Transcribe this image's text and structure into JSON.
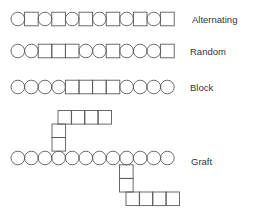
{
  "colors": {
    "stroke": "#5a5a5a",
    "text": "#333333",
    "background": "#ffffff"
  },
  "shape_size": 13.6,
  "rows": [
    {
      "id": "alternating",
      "label": "Alternating",
      "sequence": [
        "circle",
        "square",
        "circle",
        "square",
        "circle",
        "square",
        "circle",
        "square",
        "circle",
        "square",
        "circle",
        "square"
      ],
      "x": 11,
      "cy": 19,
      "label_x": 192
    },
    {
      "id": "random",
      "label": "Random",
      "sequence": [
        "circle",
        "circle",
        "square",
        "square",
        "square",
        "circle",
        "circle",
        "square",
        "circle",
        "circle",
        "circle",
        "square"
      ],
      "x": 11,
      "cy": 51,
      "label_x": 190
    },
    {
      "id": "block",
      "label": "Block",
      "sequence": [
        "circle",
        "circle",
        "circle",
        "circle",
        "square",
        "square",
        "square",
        "square",
        "circle",
        "circle",
        "circle",
        "circle"
      ],
      "x": 11,
      "cy": 87,
      "label_x": 190
    }
  ],
  "graft": {
    "label": "Graft",
    "label_x": 191,
    "backbone": {
      "x": 11,
      "cy": 158,
      "sequence": [
        "circle",
        "circle",
        "circle",
        "circle",
        "circle",
        "circle",
        "circle",
        "circle",
        "circle",
        "circle",
        "circle",
        "circle"
      ]
    },
    "upper_branch": {
      "attach_index": 3,
      "vertical": [
        {
          "x": 52,
          "y": 124
        },
        {
          "x": 52,
          "y": 137.5
        }
      ],
      "horizontal": [
        {
          "x": 58,
          "y": 110.5
        },
        {
          "x": 71.3,
          "y": 110.5
        },
        {
          "x": 84.6,
          "y": 110.5
        },
        {
          "x": 97.9,
          "y": 110.5
        }
      ]
    },
    "lower_branch": {
      "attach_index": 8,
      "vertical": [
        {
          "x": 119.5,
          "y": 164.8
        },
        {
          "x": 119.5,
          "y": 178.4
        }
      ],
      "horizontal": [
        {
          "x": 126,
          "y": 192
        },
        {
          "x": 139.3,
          "y": 192
        },
        {
          "x": 152.6,
          "y": 192
        },
        {
          "x": 165.9,
          "y": 192
        }
      ]
    }
  }
}
